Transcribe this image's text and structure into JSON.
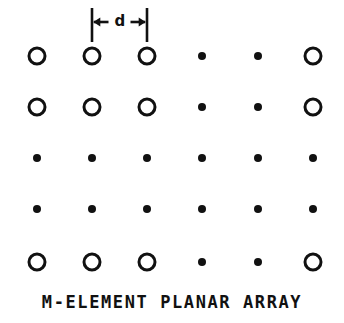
{
  "figure": {
    "caption": "M-ELEMENT PLANAR ARRAY",
    "dimension": {
      "label": "d",
      "from_column": 2,
      "to_column": 3
    },
    "colors": {
      "ink": "#111111",
      "background": "#ffffff"
    },
    "geometry": {
      "columns_x": [
        37,
        92,
        147,
        202,
        258,
        313
      ],
      "rows_y": [
        56,
        107,
        158,
        209,
        262
      ],
      "open_circle_radius": 8.0,
      "open_circle_stroke": 3.0,
      "dot_radius": 4.0
    },
    "grid": {
      "row_count": 5,
      "column_count": 6,
      "marker_legend": {
        "circle": "array element",
        "dot": "continuation ellipsis"
      },
      "rows": [
        [
          "circle",
          "circle",
          "circle",
          "dot",
          "dot",
          "circle"
        ],
        [
          "circle",
          "circle",
          "circle",
          "dot",
          "dot",
          "circle"
        ],
        [
          "dot",
          "dot",
          "dot",
          "dot",
          "dot",
          "dot"
        ],
        [
          "dot",
          "dot",
          "dot",
          "dot",
          "dot",
          "dot"
        ],
        [
          "circle",
          "circle",
          "circle",
          "dot",
          "dot",
          "circle"
        ]
      ]
    }
  }
}
